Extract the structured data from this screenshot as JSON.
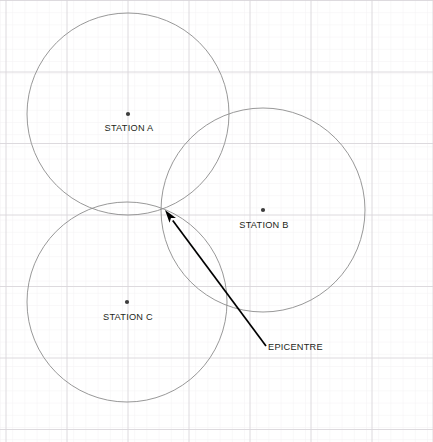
{
  "diagram": {
    "width": 433,
    "height": 442,
    "background_color": "#ffffff",
    "grid": {
      "minor_spacing": 12.2,
      "major_spacing_x": 61,
      "major_spacing_y": 71.5,
      "minor_color": "#f0eef0",
      "major_color": "#d9d6da",
      "visible": true
    },
    "circle_color": "#8c8c8c",
    "circle_stroke_width": 0.9,
    "marker_color": "#3c3c3c",
    "arrow_color": "#000000",
    "text_color": "#231f20"
  },
  "stations": [
    {
      "id": "station-a",
      "label": "STATION A",
      "center_x": 128,
      "center_y": 114,
      "radius": 101,
      "label_x": 129,
      "label_y": 131,
      "dot_radius": 2.1
    },
    {
      "id": "station-b",
      "label": "STATION B",
      "center_x": 263,
      "center_y": 210,
      "radius": 102,
      "label_x": 264,
      "label_y": 228,
      "dot_radius": 2.1
    },
    {
      "id": "station-c",
      "label": "STATION C",
      "center_x": 127,
      "center_y": 302,
      "radius": 100,
      "label_x": 128,
      "label_y": 320,
      "dot_radius": 2.1
    }
  ],
  "epicentre": {
    "label": "EPICENTRE",
    "point_x": 165,
    "point_y": 210,
    "leader_start_x": 266,
    "leader_start_y": 346,
    "label_x": 268,
    "label_y": 350,
    "arrowhead_length": 13,
    "arrowhead_width": 8
  }
}
